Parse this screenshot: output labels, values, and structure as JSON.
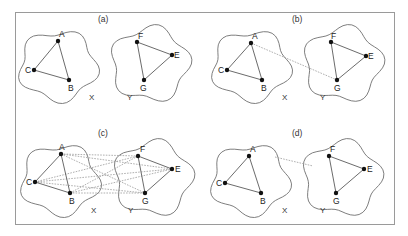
{
  "figure": {
    "frame": {
      "x": 15,
      "y": 12,
      "w": 379,
      "h": 212
    },
    "panels": [
      {
        "id": "a",
        "label": "(a)",
        "label_pos": [
          98,
          22
        ],
        "set_labels": [
          {
            "text": "X",
            "x": 89,
            "y": 100
          },
          {
            "text": "Y",
            "x": 127,
            "y": 100
          }
        ],
        "blobs": [
          {
            "cx": 58,
            "cy": 66,
            "rx": 38,
            "ry": 34
          },
          {
            "cx": 150,
            "cy": 64,
            "rx": 38,
            "ry": 36
          }
        ],
        "nodes": [
          {
            "name": "A",
            "x": 58,
            "y": 41,
            "lx": 59,
            "ly": 37
          },
          {
            "name": "C",
            "x": 34,
            "y": 70,
            "lx": 25,
            "ly": 73
          },
          {
            "name": "B",
            "x": 69,
            "y": 80,
            "lx": 68,
            "ly": 91
          },
          {
            "name": "F",
            "x": 137,
            "y": 42,
            "lx": 138,
            "ly": 39
          },
          {
            "name": "E",
            "x": 172,
            "y": 55,
            "lx": 174,
            "ly": 58
          },
          {
            "name": "G",
            "x": 144,
            "y": 80,
            "lx": 140,
            "ly": 91
          }
        ],
        "edges": [
          [
            "A",
            "B"
          ],
          [
            "B",
            "C"
          ],
          [
            "C",
            "A"
          ],
          [
            "F",
            "E"
          ],
          [
            "E",
            "G"
          ],
          [
            "G",
            "F"
          ]
        ],
        "cross_edges": []
      },
      {
        "id": "b",
        "label": "(b)",
        "label_pos": [
          292,
          22
        ],
        "set_labels": [
          {
            "text": "X",
            "x": 282,
            "y": 100
          },
          {
            "text": "Y",
            "x": 320,
            "y": 100
          }
        ],
        "blobs": [
          {
            "cx": 251,
            "cy": 66,
            "rx": 38,
            "ry": 34
          },
          {
            "cx": 343,
            "cy": 64,
            "rx": 38,
            "ry": 36
          }
        ],
        "nodes": [
          {
            "name": "A",
            "x": 251,
            "y": 43,
            "lx": 252,
            "ly": 39
          },
          {
            "name": "C",
            "x": 227,
            "y": 70,
            "lx": 218,
            "ly": 73
          },
          {
            "name": "B",
            "x": 262,
            "y": 80,
            "lx": 261,
            "ly": 91
          },
          {
            "name": "F",
            "x": 331,
            "y": 42,
            "lx": 331,
            "ly": 39
          },
          {
            "name": "E",
            "x": 366,
            "y": 56,
            "lx": 368,
            "ly": 59
          },
          {
            "name": "G",
            "x": 337,
            "y": 80,
            "lx": 334,
            "ly": 91
          }
        ],
        "edges": [
          [
            "A",
            "B"
          ],
          [
            "B",
            "C"
          ],
          [
            "C",
            "A"
          ],
          [
            "F",
            "E"
          ],
          [
            "E",
            "G"
          ],
          [
            "G",
            "F"
          ]
        ],
        "cross_edges": [
          [
            "A",
            "G"
          ]
        ]
      },
      {
        "id": "c",
        "label": "(c)",
        "label_pos": [
          98,
          136
        ],
        "set_labels": [
          {
            "text": "X",
            "x": 91,
            "y": 213
          },
          {
            "text": "Y",
            "x": 128,
            "y": 213
          }
        ],
        "blobs": [
          {
            "cx": 60,
            "cy": 180,
            "rx": 38,
            "ry": 34
          },
          {
            "cx": 153,
            "cy": 178,
            "rx": 38,
            "ry": 36
          }
        ],
        "nodes": [
          {
            "name": "A",
            "x": 61,
            "y": 154,
            "lx": 59,
            "ly": 150
          },
          {
            "name": "C",
            "x": 35,
            "y": 182,
            "lx": 26,
            "ly": 185
          },
          {
            "name": "B",
            "x": 70,
            "y": 193,
            "lx": 69,
            "ly": 204
          },
          {
            "name": "F",
            "x": 138,
            "y": 156,
            "lx": 140,
            "ly": 152
          },
          {
            "name": "E",
            "x": 172,
            "y": 169,
            "lx": 175,
            "ly": 172
          },
          {
            "name": "G",
            "x": 145,
            "y": 193,
            "lx": 142,
            "ly": 204
          }
        ],
        "edges": [
          [
            "A",
            "B"
          ],
          [
            "B",
            "C"
          ],
          [
            "C",
            "A"
          ],
          [
            "F",
            "E"
          ],
          [
            "E",
            "G"
          ],
          [
            "G",
            "F"
          ]
        ],
        "cross_edges": [
          [
            "A",
            "F"
          ],
          [
            "A",
            "E"
          ],
          [
            "A",
            "G"
          ],
          [
            "B",
            "F"
          ],
          [
            "B",
            "E"
          ],
          [
            "B",
            "G"
          ],
          [
            "C",
            "F"
          ],
          [
            "C",
            "E"
          ],
          [
            "C",
            "G"
          ]
        ]
      },
      {
        "id": "d",
        "label": "(d)",
        "label_pos": [
          292,
          136
        ],
        "set_labels": [
          {
            "text": "X",
            "x": 282,
            "y": 213
          },
          {
            "text": "Y",
            "x": 320,
            "y": 213
          }
        ],
        "blobs": [
          {
            "cx": 250,
            "cy": 180,
            "rx": 38,
            "ry": 34
          },
          {
            "cx": 342,
            "cy": 178,
            "rx": 38,
            "ry": 36
          }
        ],
        "nodes": [
          {
            "name": "A",
            "x": 249,
            "y": 156,
            "lx": 250,
            "ly": 152
          },
          {
            "name": "C",
            "x": 225,
            "y": 183,
            "lx": 216,
            "ly": 186
          },
          {
            "name": "B",
            "x": 261,
            "y": 193,
            "lx": 260,
            "ly": 204
          },
          {
            "name": "F",
            "x": 329,
            "y": 156,
            "lx": 330,
            "ly": 152
          },
          {
            "name": "E",
            "x": 364,
            "y": 169,
            "lx": 367,
            "ly": 172
          },
          {
            "name": "G",
            "x": 336,
            "y": 193,
            "lx": 333,
            "ly": 204
          }
        ],
        "edges": [
          [
            "A",
            "B"
          ],
          [
            "B",
            "C"
          ],
          [
            "C",
            "A"
          ],
          [
            "F",
            "E"
          ],
          [
            "E",
            "G"
          ],
          [
            "G",
            "F"
          ]
        ],
        "cross_edges": [],
        "blob_link": {
          "x1": 275,
          "y1": 157,
          "x2": 313,
          "y2": 166
        }
      }
    ]
  }
}
